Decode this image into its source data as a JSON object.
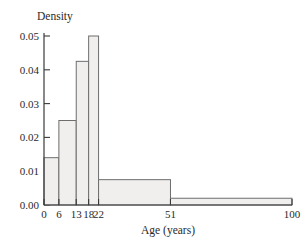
{
  "chart_data": {
    "type": "bar",
    "title": "",
    "subtitle": "",
    "xlabel": "Age (years)",
    "ylabel": "Density",
    "xlim": [
      0,
      100
    ],
    "ylim": [
      0,
      0.05
    ],
    "grid": false,
    "legend": null,
    "histogram": true,
    "bin_edges": [
      0,
      6,
      13,
      18,
      22,
      51,
      100
    ],
    "categories": [
      "0-6",
      "6-13",
      "13-18",
      "18-22",
      "22-51",
      "51-100"
    ],
    "values": [
      0.014,
      0.025,
      0.0425,
      0.05,
      0.0075,
      0.002
    ],
    "bars": [
      {
        "label": "0-6",
        "start": 0,
        "end": 6,
        "density": 0.014
      },
      {
        "label": "6-13",
        "start": 6,
        "end": 13,
        "density": 0.025
      },
      {
        "label": "13-18",
        "start": 13,
        "end": 18,
        "density": 0.0425
      },
      {
        "label": "18-22",
        "start": 18,
        "end": 22,
        "density": 0.05
      },
      {
        "label": "22-51",
        "start": 22,
        "end": 51,
        "density": 0.0075
      },
      {
        "label": "51-100",
        "start": 51,
        "end": 100,
        "density": 0.002
      }
    ],
    "xticks": [
      0,
      6,
      13,
      18,
      22,
      51,
      100
    ],
    "xticklabels": [
      "0",
      "6",
      "13",
      "18",
      "22",
      "51",
      "100"
    ],
    "yticks": [
      0.0,
      0.01,
      0.02,
      0.03,
      0.04,
      0.05
    ],
    "yticklabels": [
      "0.00",
      "0.01",
      "0.02",
      "0.03",
      "0.04",
      "0.05"
    ],
    "colors": {
      "bar_fill": "#f0efed",
      "bar_stroke": "#6e6e6e",
      "axis": "#3a3a3a",
      "text": "#2a2a2a",
      "background": "#ffffff"
    }
  }
}
